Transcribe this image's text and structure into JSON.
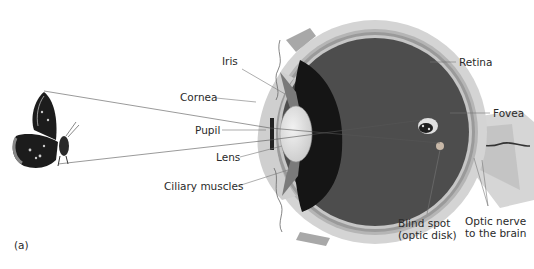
{
  "diagram": {
    "panel_label": "(a)",
    "object": "butterfly",
    "labels": {
      "iris": "Iris",
      "cornea": "Cornea",
      "pupil": "Pupil",
      "lens": "Lens",
      "ciliary_muscles": "Ciliary muscles",
      "retina": "Retina",
      "fovea": "Fovea",
      "blind_spot_line1": "Blind spot",
      "blind_spot_line2": "(optic disk)",
      "optic_nerve_line1": "Optic nerve",
      "optic_nerve_line2": "to the brain"
    },
    "colors": {
      "sclera": "#d4d4d4",
      "choroid": "#9a9a9a",
      "retina_layer": "#bdbdbd",
      "vitreous": "#4a4a4a",
      "shadow": "#1a1a1a",
      "lens": "#e6e6e6",
      "leader_line": "#777777",
      "ray_line": "#555555"
    }
  }
}
